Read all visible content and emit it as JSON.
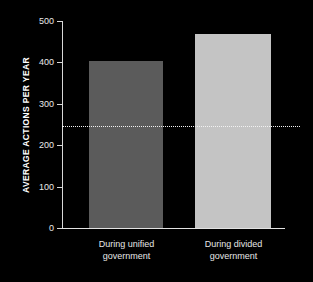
{
  "chart_data": {
    "type": "bar",
    "title": "",
    "xlabel": "",
    "ylabel": "AVERAGE ACTIONS PER YEAR",
    "categories": [
      "During unified\ngovernment",
      "During divided\ngovernment"
    ],
    "values": [
      403,
      469
    ],
    "ylim": [
      0,
      500
    ],
    "yticks": [
      0,
      100,
      200,
      300,
      400,
      500
    ],
    "ytick_labels": [
      "0",
      "100",
      "200",
      "300",
      "400",
      "500"
    ],
    "grid": false,
    "legend": "none",
    "background_color": "#000000",
    "bar_colors": [
      "#5b5b5b",
      "#c4c4c4"
    ],
    "annotations": [
      {
        "type": "reference-line",
        "style": "dotted",
        "value": 245,
        "color": "#f2f2f2",
        "label": ""
      }
    ]
  }
}
